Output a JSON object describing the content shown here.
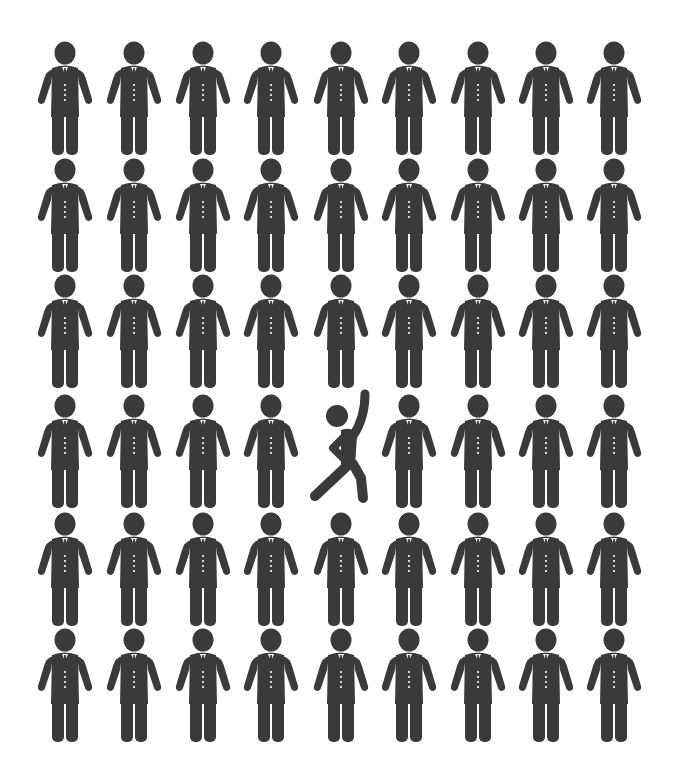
{
  "illustration": {
    "subject": "grid of businessman pictograms with one dancing figure",
    "rows": 6,
    "columns": 9,
    "figure_color": "#3a3a3a",
    "background_color": "#ffffff",
    "button_color": "#ffffff",
    "column_centers_x": [
      65,
      134,
      203,
      271,
      341,
      409,
      478,
      546,
      614
    ],
    "row_head_top_y": [
      41,
      158,
      274,
      394,
      512,
      628
    ],
    "odd_one_out": {
      "row": 3,
      "column": 4,
      "type": "dancer"
    },
    "default_type": "businessman"
  }
}
